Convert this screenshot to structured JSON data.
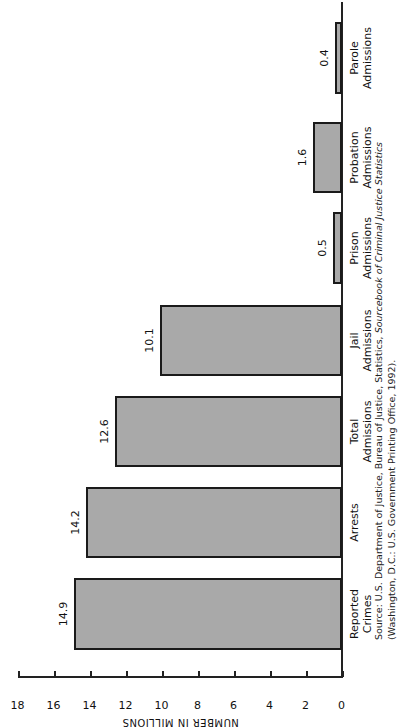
{
  "chart_data": {
    "type": "bar",
    "orientation": "rotated-90-ccw",
    "title": "",
    "xlabel": "",
    "ylabel": "NUMBER IN MILLIONS",
    "ylim": [
      0,
      18
    ],
    "yticks": [
      0,
      2,
      4,
      6,
      8,
      10,
      12,
      14,
      16,
      18
    ],
    "categories": [
      "Reported Crimes",
      "Arrests",
      "Total Admissions",
      "Jail Admissions",
      "Prison Admissions",
      "Probation Admissions",
      "Parole Admissions"
    ],
    "values": [
      14.9,
      14.2,
      12.6,
      10.1,
      0.5,
      1.6,
      0.4
    ],
    "value_labels": [
      "14.9",
      "14.2",
      "12.6",
      "10.1",
      "0.5",
      "1.6",
      "0.4"
    ],
    "bar_color": "#a9a9a9",
    "grid": false,
    "legend": null
  },
  "axis": {
    "title": "NUMBER IN MILLIONS",
    "ticks": [
      "0",
      "2",
      "4",
      "6",
      "8",
      "10",
      "12",
      "14",
      "16",
      "18"
    ]
  },
  "bars": [
    {
      "line1": "Reported",
      "line2": "Crimes",
      "value": "14.9"
    },
    {
      "line1": "Arrests",
      "line2": "",
      "value": "14.2"
    },
    {
      "line1": "Total",
      "line2": "Admissions",
      "value": "12.6"
    },
    {
      "line1": "Jail",
      "line2": "Admissions",
      "value": "10.1"
    },
    {
      "line1": "Prison",
      "line2": "Admissions",
      "value": "0.5"
    },
    {
      "line1": "Probation",
      "line2": "Admissions",
      "value": "1.6"
    },
    {
      "line1": "Parole",
      "line2": "Admissions",
      "value": "0.4"
    }
  ],
  "source": {
    "prefix": "Source: U.S. Department of Justice, Bureau of Justice, Statistics, ",
    "italic": "Sourcebook of Criminal Justice Statistics",
    "line2": "(Washington, D.C.: U.S. Government Printing Office, 1992)."
  }
}
